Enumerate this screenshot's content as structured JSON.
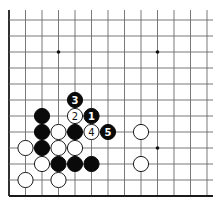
{
  "diagram": {
    "type": "go-board-corner",
    "grid": {
      "origin_x": 9,
      "origin_y": 20,
      "spacing_x": 16.5,
      "spacing_y": 16,
      "columns": 13,
      "rows": 12,
      "edges": [
        "left",
        "bottom"
      ]
    },
    "colors": {
      "black": "#0a0a0a",
      "white": "#ffffff",
      "line": "#6a6a6a",
      "edge": "#1a1a1a"
    },
    "star_points": [
      {
        "col": 3,
        "row": 2
      },
      {
        "col": 9,
        "row": 2
      },
      {
        "col": 9,
        "row": 8
      }
    ],
    "stones": [
      {
        "color": "black",
        "col": 4,
        "row": 5,
        "label": "3"
      },
      {
        "color": "white",
        "col": 4,
        "row": 6,
        "label": "2"
      },
      {
        "color": "black",
        "col": 5,
        "row": 6,
        "label": "1"
      },
      {
        "color": "black",
        "col": 2,
        "row": 6,
        "label": ""
      },
      {
        "color": "black",
        "col": 2,
        "row": 7,
        "label": ""
      },
      {
        "color": "white",
        "col": 3,
        "row": 7,
        "label": ""
      },
      {
        "color": "black",
        "col": 4,
        "row": 7,
        "label": ""
      },
      {
        "color": "white",
        "col": 5,
        "row": 7,
        "label": "4"
      },
      {
        "color": "black",
        "col": 6,
        "row": 7,
        "label": "5"
      },
      {
        "color": "white",
        "col": 8,
        "row": 7,
        "label": ""
      },
      {
        "color": "white",
        "col": 1,
        "row": 8,
        "label": ""
      },
      {
        "color": "black",
        "col": 2,
        "row": 8,
        "label": ""
      },
      {
        "color": "white",
        "col": 3,
        "row": 8,
        "label": ""
      },
      {
        "color": "white",
        "col": 4,
        "row": 8,
        "label": ""
      },
      {
        "color": "white",
        "col": 2,
        "row": 9,
        "label": ""
      },
      {
        "color": "black",
        "col": 3,
        "row": 9,
        "label": ""
      },
      {
        "color": "black",
        "col": 4,
        "row": 9,
        "label": ""
      },
      {
        "color": "black",
        "col": 5,
        "row": 9,
        "label": ""
      },
      {
        "color": "white",
        "col": 8,
        "row": 9,
        "label": ""
      },
      {
        "color": "white",
        "col": 1,
        "row": 10,
        "label": ""
      },
      {
        "color": "white",
        "col": 3,
        "row": 10,
        "label": ""
      }
    ],
    "move_labels": [
      "1",
      "2",
      "3",
      "4",
      "5"
    ]
  }
}
